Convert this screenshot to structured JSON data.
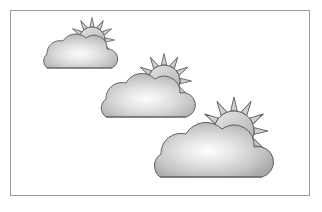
{
  "scene": {
    "title": "Sun behind cloud weather icons",
    "background_color": "#ffffff",
    "frame": {
      "name": "border-frame",
      "x": 10,
      "y": 10,
      "width": 300,
      "height": 186,
      "stroke_color": "#9a9a9a",
      "stroke_width": 1,
      "fill_color": "#ffffff"
    },
    "palette": {
      "outline": "#5d5d5d",
      "cloud_highlight": "#fdfdfd",
      "cloud_mid": "#c9c9c9",
      "cloud_edge": "#a9a9a9",
      "sun_light": "#dcdcdc",
      "sun_mid": "#bdbdbd",
      "sun_edge": "#a6a6a6",
      "ray_fill": "#cfcfcf",
      "shadow": "#d8d8d8"
    },
    "icons": [
      {
        "id": "weather-icon-small",
        "label": "Sun behind cloud",
        "size_name": "small",
        "scale": 0.6,
        "x": 30,
        "y": 16,
        "sun": {
          "cx": 62,
          "cy": 22,
          "r": 13,
          "ray_count": 12,
          "ray_length": 9
        },
        "cloud": {
          "cx": 45,
          "cy": 42,
          "width": 76,
          "height": 32
        }
      },
      {
        "id": "weather-icon-medium",
        "label": "Sun behind cloud",
        "size_name": "medium",
        "scale": 0.78,
        "x": 92,
        "y": 52,
        "sun": {
          "cx": 68,
          "cy": 24,
          "r": 16,
          "ray_count": 12,
          "ray_length": 11
        },
        "cloud": {
          "cx": 48,
          "cy": 46,
          "width": 95,
          "height": 40
        }
      },
      {
        "id": "weather-icon-large",
        "label": "Sun behind cloud",
        "size_name": "large",
        "scale": 1.0,
        "x": 146,
        "y": 96,
        "sun": {
          "cx": 84,
          "cy": 30,
          "r": 20,
          "ray_count": 12,
          "ray_length": 14
        },
        "cloud": {
          "cx": 58,
          "cy": 58,
          "width": 120,
          "height": 50
        }
      }
    ]
  }
}
